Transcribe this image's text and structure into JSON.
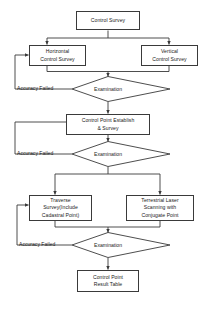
{
  "diagram": {
    "type": "flowchart",
    "colors": {
      "stroke": "#3a3a3a",
      "text": "#1a1a1a",
      "background": "#ffffff"
    },
    "nodes": {
      "control_survey": {
        "line1": "Control Survey"
      },
      "horizontal_control_survey": {
        "line1": "Horizontal",
        "line2": "Control Survey"
      },
      "vertical_control_survey": {
        "line1": "Vertical",
        "line2": "Control Survey"
      },
      "examination_1": {
        "label": "Examination"
      },
      "control_point_establish": {
        "line1": "Control Point Establish",
        "line2": "& Survey"
      },
      "examination_2": {
        "label": "Examination"
      },
      "traverse_survey": {
        "line1": "Traverse",
        "line2": "Survey(Include",
        "line3": "Cadastral Point)"
      },
      "terrestrial_laser_scanning": {
        "line1": "Terrestrial Laser",
        "line2": "Scanning with",
        "line3": "Conjugate Point"
      },
      "examination_3": {
        "label": "Examination"
      },
      "control_point_result_table": {
        "line1": "Control Point",
        "line2": "Result Table"
      }
    },
    "edge_labels": {
      "accuracy_failed_1": "Accuracy Failed",
      "accuracy_failed_2": "Accuracy Failed",
      "accuracy_failed_3": "Accuracy Failed"
    }
  }
}
